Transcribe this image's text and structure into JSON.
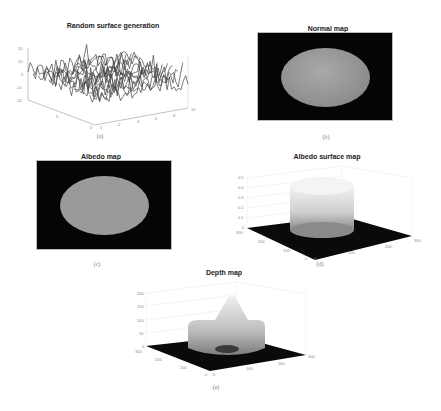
{
  "panels": {
    "a": {
      "title": "Random surface generation",
      "caption": "(a)",
      "z_ticks": [
        "20",
        "10",
        "0",
        "-10",
        "-20"
      ],
      "x_ticks": [
        "0",
        "2",
        "4",
        "6",
        "8",
        "10"
      ],
      "y_ticks": [
        "0",
        "5",
        "10"
      ]
    },
    "b": {
      "title": "Normal map",
      "caption": "(b)"
    },
    "c": {
      "title": "Albedo map",
      "caption": "(c)"
    },
    "d": {
      "title": "Albedo surface map",
      "caption": "(d)",
      "z_ticks": [
        "0.5",
        "0.4",
        "0.3",
        "0.2",
        "0.1",
        "0"
      ],
      "x_ticks": [
        "0",
        "100",
        "200",
        "300"
      ],
      "y_ticks": [
        "0",
        "100",
        "200",
        "300"
      ]
    },
    "e": {
      "title": "Depth map",
      "caption": "(e)",
      "z_ticks": [
        "200",
        "150",
        "100",
        "50",
        "0"
      ],
      "x_ticks": [
        "0",
        "100",
        "200",
        "300"
      ],
      "y_ticks": [
        "0",
        "100",
        "200",
        "300"
      ]
    }
  },
  "chart_data": [
    {
      "type": "surface",
      "title": "Random surface generation",
      "xlabel": "",
      "ylabel": "",
      "zlabel": "",
      "x_range": [
        0,
        10
      ],
      "y_range": [
        0,
        10
      ],
      "z_range": [
        -20,
        20
      ],
      "z_ticks": [
        -20,
        -10,
        0,
        10,
        20
      ],
      "grid": false,
      "description": "Dense random noise surface, values roughly between -15 and 15 with spikes up to ~20"
    },
    {
      "type": "image",
      "title": "Normal map",
      "description": "Black background with a centered gray shaded ellipse (sphere normal map)"
    },
    {
      "type": "image",
      "title": "Albedo map",
      "description": "Black background with a centered uniform gray ellipse"
    },
    {
      "type": "surface",
      "title": "Albedo surface map",
      "x_range": [
        0,
        300
      ],
      "y_range": [
        0,
        300
      ],
      "z_range": [
        0,
        0.5
      ],
      "z_ticks": [
        0,
        0.1,
        0.2,
        0.3,
        0.4,
        0.5
      ],
      "grid": true,
      "description": "Flat zero plane with a central cylinder of height ~0.4"
    },
    {
      "type": "surface",
      "title": "Depth map",
      "x_range": [
        0,
        300
      ],
      "y_range": [
        0,
        300
      ],
      "z_range": [
        0,
        200
      ],
      "z_ticks": [
        0,
        50,
        100,
        150,
        200
      ],
      "grid": true,
      "description": "Flat zero plane with a raised cross/dome shape, plateau ~75, peak ~170"
    }
  ]
}
